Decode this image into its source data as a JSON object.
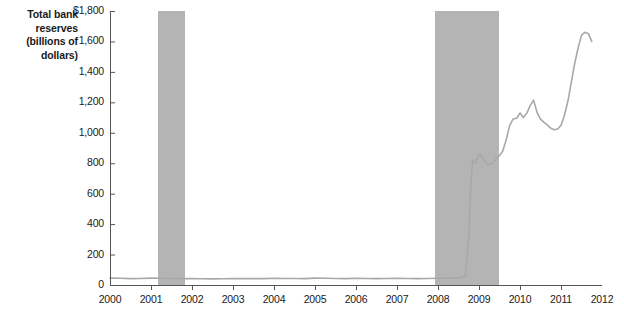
{
  "chart_data": {
    "type": "line",
    "title": "",
    "subtitle": "",
    "xlabel": "",
    "ylabel": "Total bank reserves (billions of dollars)",
    "ylabel_lines": [
      "Total bank",
      "reserves",
      "(billions of",
      "dollars)"
    ],
    "xlim": [
      2000,
      2012
    ],
    "ylim": [
      0,
      1800
    ],
    "grid": false,
    "legend": "none",
    "y_ticks": [
      0,
      200,
      400,
      600,
      800,
      1000,
      1200,
      1400,
      1600,
      1800
    ],
    "y_tick_labels": [
      "0",
      "200",
      "400",
      "600",
      "800",
      "1,000",
      "1,200",
      "1,400",
      "1,600",
      "$1,800"
    ],
    "x_ticks": [
      2000,
      2001,
      2002,
      2003,
      2004,
      2005,
      2006,
      2007,
      2008,
      2009,
      2010,
      2011,
      2012
    ],
    "x_tick_labels": [
      "2000",
      "2001",
      "2002",
      "2003",
      "2004",
      "2005",
      "2006",
      "2007",
      "2008",
      "2009",
      "2010",
      "2011",
      "2012"
    ],
    "series": [
      {
        "name": "Total bank reserves",
        "color": "#a8a8a8",
        "x": [
          2000.0,
          2000.25,
          2000.5,
          2000.75,
          2001.0,
          2001.25,
          2001.5,
          2001.75,
          2002.0,
          2002.25,
          2002.5,
          2002.75,
          2003.0,
          2003.25,
          2003.5,
          2003.75,
          2004.0,
          2004.25,
          2004.5,
          2004.75,
          2005.0,
          2005.25,
          2005.5,
          2005.75,
          2006.0,
          2006.25,
          2006.5,
          2006.75,
          2007.0,
          2007.25,
          2007.5,
          2007.75,
          2008.0,
          2008.25,
          2008.5,
          2008.67,
          2008.75,
          2008.8,
          2008.85,
          2008.92,
          2009.0,
          2009.08,
          2009.17,
          2009.25,
          2009.33,
          2009.42,
          2009.5,
          2009.58,
          2009.67,
          2009.75,
          2009.83,
          2009.92,
          2010.0,
          2010.08,
          2010.17,
          2010.25,
          2010.33,
          2010.42,
          2010.5,
          2010.58,
          2010.67,
          2010.75,
          2010.83,
          2010.92,
          2011.0,
          2011.08,
          2011.17,
          2011.25,
          2011.33,
          2011.42,
          2011.5,
          2011.58,
          2011.67,
          2011.75
        ],
        "y": [
          45,
          44,
          42,
          43,
          45,
          44,
          43,
          42,
          42,
          41,
          40,
          41,
          42,
          43,
          42,
          42,
          44,
          43,
          43,
          42,
          45,
          44,
          43,
          42,
          44,
          43,
          42,
          43,
          44,
          43,
          42,
          43,
          44,
          45,
          46,
          60,
          310,
          660,
          820,
          800,
          860,
          840,
          800,
          790,
          800,
          830,
          850,
          880,
          960,
          1050,
          1090,
          1095,
          1130,
          1100,
          1130,
          1180,
          1215,
          1130,
          1090,
          1070,
          1050,
          1030,
          1020,
          1025,
          1050,
          1110,
          1210,
          1330,
          1450,
          1560,
          1640,
          1660,
          1650,
          1600
        ]
      }
    ],
    "shaded_regions": [
      {
        "label": "recession-2001",
        "x_start": 2001.17,
        "x_end": 2001.83,
        "color": "#b4b4b4"
      },
      {
        "label": "recession-2008",
        "x_start": 2007.92,
        "x_end": 2009.5,
        "color": "#b4b4b4"
      }
    ],
    "axis_color": "#555555",
    "text_color": "#1a1a1a"
  }
}
